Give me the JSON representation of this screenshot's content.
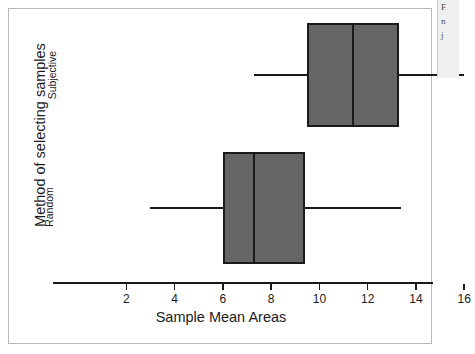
{
  "figure": {
    "background_color": "#ffffff",
    "frame_color": "#b9b9b9"
  },
  "side_fragment": {
    "name": "page-edge-fragment",
    "lines": [
      "F",
      "n",
      "j"
    ]
  },
  "chart_data": {
    "type": "box",
    "orientation": "horizontal",
    "title": "",
    "xlabel": "Sample Mean Areas",
    "ylabel": "Method of selecting samples",
    "categories": [
      "Subjective",
      "Random"
    ],
    "xlim": [
      1,
      17
    ],
    "xticks": [
      2,
      4,
      6,
      8,
      10,
      12,
      14,
      16
    ],
    "xtick_labels": [
      "2",
      "4",
      "6",
      "8",
      "10",
      "12",
      "14",
      "16"
    ],
    "grid": false,
    "legend": "none",
    "box_fill_color": "#656565",
    "box_edge_color": "#1a1a1a",
    "boxes": [
      {
        "category": "Subjective",
        "whisker_low": 7.3,
        "q1": 9.5,
        "median": 11.4,
        "q3": 13.3,
        "whisker_high": 16.0
      },
      {
        "category": "Random",
        "whisker_low": 3.0,
        "q1": 6.0,
        "median": 7.3,
        "q3": 9.4,
        "whisker_high": 13.4
      }
    ]
  }
}
